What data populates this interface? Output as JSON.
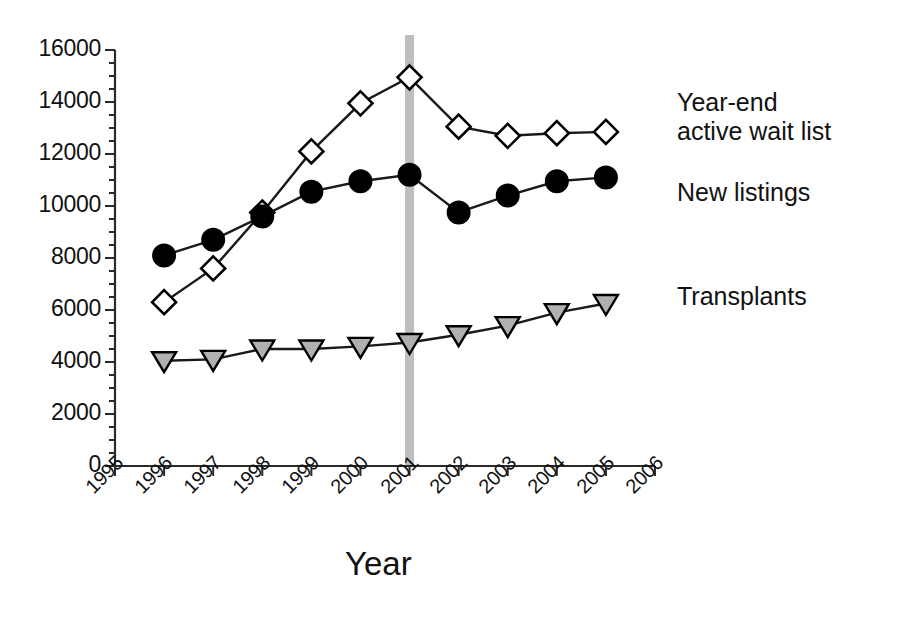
{
  "chart_data": {
    "type": "line",
    "title": "",
    "subtitle": "",
    "xlabel": "Year",
    "ylabel": "",
    "xlim": [
      1995,
      2006
    ],
    "ylim": [
      0,
      16000
    ],
    "grid": false,
    "legend_position": "inline-right",
    "x_tick_labels": [
      "1995",
      "1996",
      "1997",
      "1998",
      "1999",
      "2000",
      "2001",
      "2002",
      "2003",
      "2004",
      "2005",
      "2006"
    ],
    "y_tick_labels": [
      "0",
      "2000",
      "4000",
      "6000",
      "8000",
      "10000",
      "12000",
      "14000",
      "16000"
    ],
    "y_major_step": 2000,
    "y_minor_step": 500,
    "annotations": [
      {
        "name": "reference-band",
        "type": "vertical-band",
        "x": 2001,
        "color": "#b3b3b3"
      }
    ],
    "x": [
      1996,
      1997,
      1998,
      1999,
      2000,
      2001,
      2002,
      2003,
      2004,
      2005
    ],
    "series": [
      {
        "name": "Year-end active wait list",
        "marker": "open-diamond",
        "marker_fill": "#ffffff",
        "marker_stroke": "#000000",
        "values": [
          6300,
          7600,
          9750,
          12100,
          13950,
          14950,
          13050,
          12700,
          12800,
          12850
        ]
      },
      {
        "name": "New listings",
        "marker": "filled-circle",
        "marker_fill": "#000000",
        "marker_stroke": "#000000",
        "values": [
          8100,
          8700,
          9600,
          10550,
          10950,
          11200,
          9750,
          10400,
          10950,
          11100
        ]
      },
      {
        "name": "Transplants",
        "marker": "gray-down-triangle",
        "marker_fill": "#b0b0b0",
        "marker_stroke": "#000000",
        "values": [
          4050,
          4100,
          4500,
          4500,
          4600,
          4750,
          5050,
          5400,
          5900,
          6250
        ]
      }
    ]
  },
  "labels": {
    "waitlist": "Year-end\nactive wait list",
    "new_listings": "New listings",
    "transplants": "Transplants"
  },
  "colors": {
    "axis": "#2a2a2a",
    "line": "#1a1a1a",
    "band": "#b3b3b3",
    "triangle_fill": "#b0b0b0"
  }
}
